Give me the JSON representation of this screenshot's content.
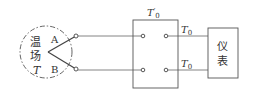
{
  "diagram": {
    "field": {
      "line1": "温",
      "line2": "场",
      "symbol": "T"
    },
    "junction_labels": {
      "a": "A",
      "b": "B"
    },
    "compensator": {
      "label": "T",
      "label_sub": "0",
      "label_prime": "′"
    },
    "output_labels": {
      "top": "T",
      "top_sub": "0",
      "bottom": "T",
      "bottom_sub": "0"
    },
    "instrument": {
      "line1": "仪",
      "line2": "表"
    },
    "colors": {
      "stroke": "#444444",
      "dash": "#555555"
    }
  }
}
